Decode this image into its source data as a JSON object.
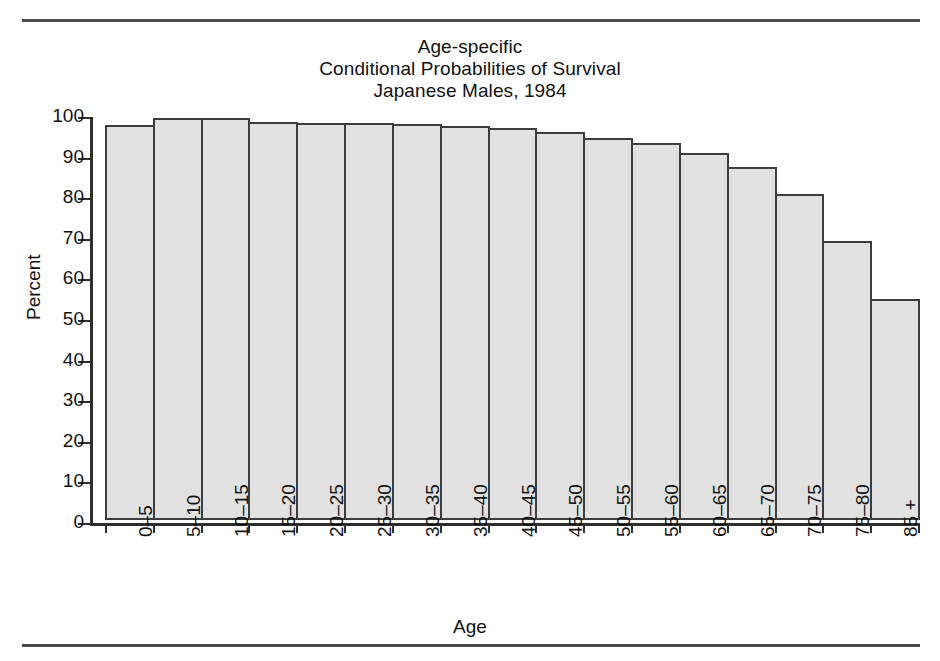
{
  "chart_data": {
    "type": "bar",
    "title": "Age-specific\nConditional Probabilities of Survival\nJapanese Males, 1984",
    "title_lines": [
      "Age-specific",
      "Conditional Probabilities of Survival",
      "Japanese Males, 1984"
    ],
    "xlabel": "Age",
    "ylabel": "Percent",
    "categories": [
      "0–5",
      "5–10",
      "10–15",
      "15–20",
      "20–25",
      "25–30",
      "30–35",
      "35–40",
      "40–45",
      "45–50",
      "50–55",
      "55–60",
      "60–65",
      "65–70",
      "70–75",
      "75–80",
      "85 +"
    ],
    "values": [
      97.3,
      99.0,
      99.0,
      98.0,
      97.9,
      97.9,
      97.6,
      97.1,
      96.6,
      95.6,
      94.0,
      92.8,
      90.4,
      87.0,
      80.4,
      68.8,
      54.4
    ],
    "ylim": [
      0,
      100
    ],
    "ytick_labels": [
      "0",
      "10",
      "20",
      "30",
      "40",
      "50",
      "60",
      "70",
      "80",
      "90",
      "100"
    ],
    "ytick_values": [
      0,
      10,
      20,
      30,
      40,
      50,
      60,
      70,
      80,
      90,
      100
    ],
    "grid": false,
    "legend": false,
    "bar_fill_color": "#e1e1e1",
    "bar_edge_color": "#3d3d3d",
    "axis_color": "#2e2e2e",
    "rule_color": "#4a4a4a",
    "xlabel_rotation": 90
  }
}
